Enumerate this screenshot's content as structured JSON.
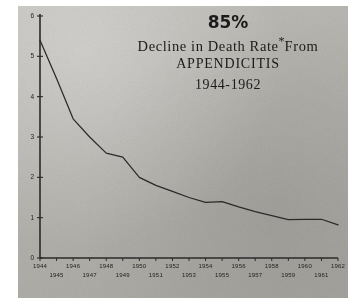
{
  "figure": {
    "kind": "scanned-line-chart",
    "plate_color": "#b9b7b2",
    "ink_color": "#2a2a2a",
    "background": "#ffffff"
  },
  "title": {
    "headline": "85%",
    "line2_prefix": "Decline in Death Rate",
    "line2_marker": "*",
    "line2_suffix": "From",
    "line3": "APPENDICITIS",
    "line4": "1944-1962"
  },
  "chart_data": {
    "type": "line",
    "xlabel": "",
    "ylabel": "",
    "grid": false,
    "legend": false,
    "xlim": [
      1944,
      1962
    ],
    "ylim": [
      0,
      6
    ],
    "yticks": [
      "0",
      "1",
      "2",
      "3",
      "4",
      "5",
      "6"
    ],
    "ytick_values": [
      0,
      1,
      2,
      3,
      4,
      5,
      6
    ],
    "xticks": [
      "1944",
      "1945",
      "1946",
      "1947",
      "1948",
      "1949",
      "1950",
      "1951",
      "1952",
      "1953",
      "1954",
      "1955",
      "1956",
      "1957",
      "1958",
      "1959",
      "1960",
      "1961",
      "1962"
    ],
    "xtick_rows": {
      "upper": [
        "1944",
        "1946",
        "1948",
        "1950",
        "1952",
        "1954",
        "1956",
        "1958",
        "1960",
        "1962"
      ],
      "lower": [
        "1945",
        "1947",
        "1949",
        "1951",
        "1953",
        "1955",
        "1957",
        "1959",
        "1961"
      ]
    },
    "x": [
      1944,
      1945,
      1946,
      1947,
      1948,
      1949,
      1950,
      1951,
      1952,
      1953,
      1954,
      1955,
      1956,
      1957,
      1958,
      1959,
      1960,
      1961,
      1962
    ],
    "values": [
      5.4,
      4.45,
      3.45,
      3.0,
      2.6,
      2.5,
      2.0,
      1.8,
      1.65,
      1.5,
      1.38,
      1.4,
      1.27,
      1.15,
      1.05,
      0.95,
      0.96,
      0.96,
      0.82
    ],
    "series": [
      {
        "name": "Appendicitis death rate",
        "values": [
          5.4,
          4.45,
          3.45,
          3.0,
          2.6,
          2.5,
          2.0,
          1.8,
          1.65,
          1.5,
          1.38,
          1.4,
          1.27,
          1.15,
          1.05,
          0.95,
          0.96,
          0.96,
          0.82
        ]
      }
    ]
  }
}
